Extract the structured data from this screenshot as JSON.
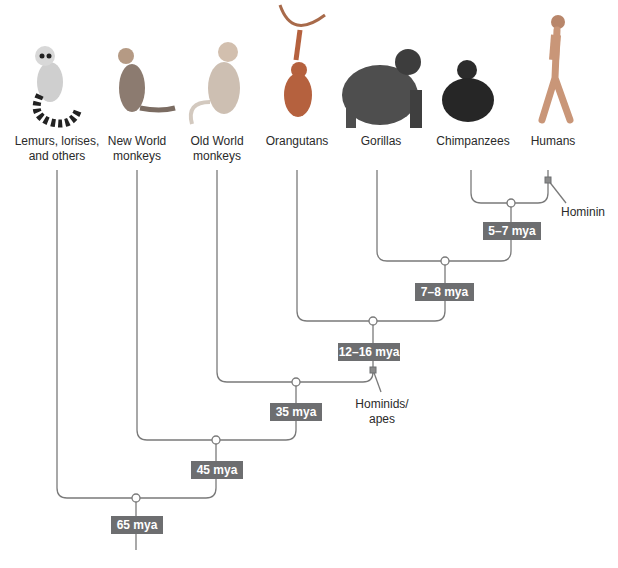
{
  "diagram": {
    "type": "phylogenetic-tree",
    "title": "",
    "colors": {
      "line": "#7a7a7a",
      "label_bg": "#6d6e70",
      "label_text": "#ffffff",
      "text": "#2a2a2a"
    },
    "taxa": [
      {
        "id": "lemurs",
        "label": "Lemurs, lorises,\nand others",
        "icon": "lemur-icon"
      },
      {
        "id": "new-world",
        "label": "New World\nmonkeys",
        "icon": "capuchin-monkey-icon"
      },
      {
        "id": "old-world",
        "label": "Old World\nmonkeys",
        "icon": "macaque-monkey-icon"
      },
      {
        "id": "orangutans",
        "label": "Orangutans",
        "icon": "orangutan-icon"
      },
      {
        "id": "gorillas",
        "label": "Gorillas",
        "icon": "gorilla-icon"
      },
      {
        "id": "chimpanzees",
        "label": "Chimpanzees",
        "icon": "chimpanzee-icon"
      },
      {
        "id": "humans",
        "label": "Humans",
        "icon": "human-icon"
      }
    ],
    "divergences": [
      {
        "id": "node-chimp-human",
        "label": "5–7 mya",
        "joins": [
          "chimpanzees",
          "humans"
        ]
      },
      {
        "id": "node-gorilla",
        "label": "7–8 mya",
        "joins": [
          "gorillas",
          "node-chimp-human"
        ]
      },
      {
        "id": "node-orangutan",
        "label": "12–16 mya",
        "joins": [
          "orangutans",
          "node-gorilla"
        ]
      },
      {
        "id": "node-old-world",
        "label": "35 mya",
        "joins": [
          "old-world",
          "node-orangutan"
        ]
      },
      {
        "id": "node-new-world",
        "label": "45 mya",
        "joins": [
          "new-world",
          "node-old-world"
        ]
      },
      {
        "id": "node-root",
        "label": "65 mya",
        "joins": [
          "lemurs",
          "node-new-world"
        ]
      }
    ],
    "annotations": [
      {
        "id": "hominin",
        "label": "Hominin"
      },
      {
        "id": "hominids",
        "label": "Hominids/\napes"
      }
    ]
  }
}
